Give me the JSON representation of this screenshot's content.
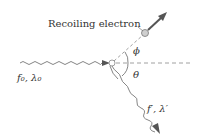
{
  "diagram": {
    "labels": {
      "recoiling_electron": "Recoiling electron",
      "incident_photon": "f₀, λ₀",
      "scattered_photon": "f′, λ′",
      "electron_angle": "ϕ",
      "photon_angle": "θ"
    },
    "colors": {
      "line": "#666666",
      "arrow": "#555555",
      "dashed": "#888888",
      "electron_fill": "#cfcfcf",
      "text": "#333333"
    }
  }
}
